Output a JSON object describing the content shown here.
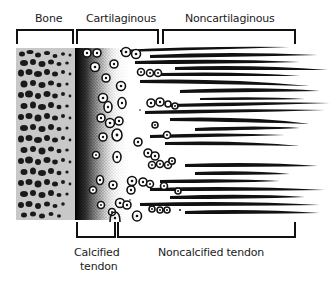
{
  "figure": {
    "type": "enthesis-schematic",
    "top_labels": {
      "bone": "Bone",
      "cartilaginous": "Cartilaginous",
      "noncartilaginous": "Noncartilaginous"
    },
    "bottom_labels": {
      "calcified_line1": "Calcified",
      "calcified_line2": "tendon",
      "noncalcified": "Noncalcified tendon"
    },
    "colors": {
      "bone_background": "#c8c8c8",
      "ink": "#111111",
      "paper": "#ffffff"
    }
  }
}
